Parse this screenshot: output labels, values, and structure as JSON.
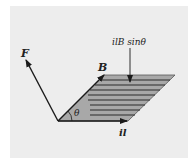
{
  "diagram": {
    "labels": {
      "force": "F",
      "field": "B",
      "current": "il",
      "angle": "θ",
      "area": "ilB sinθ"
    },
    "colors": {
      "background": "#ededed",
      "fill": "#a8a8a8",
      "stroke": "#1a1a1a"
    }
  }
}
